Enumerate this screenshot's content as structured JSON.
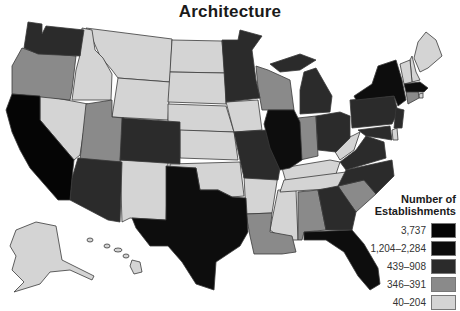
{
  "title": "Architecture",
  "legend": {
    "title_line1": "Number of",
    "title_line2": "Establishments",
    "items": [
      {
        "label": "3,737",
        "color": "#050505"
      },
      {
        "label": "1,204–2,284",
        "color": "#0d0d0d"
      },
      {
        "label": "439–908",
        "color": "#2b2b2b"
      },
      {
        "label": "346–391",
        "color": "#8a8a8a"
      },
      {
        "label": "40–204",
        "color": "#d4d4d4"
      }
    ]
  },
  "categories": {
    "3,737": [
      "CA"
    ],
    "1,204–2,284": [
      "NY",
      "TX",
      "FL",
      "IL",
      "MA"
    ],
    "439–908": [
      "WA",
      "CO",
      "AZ",
      "MN",
      "MI",
      "OH",
      "PA",
      "MO",
      "NJ",
      "VA",
      "NC",
      "GA",
      "TN-none",
      "MD"
    ],
    "346–391": [
      "OR",
      "UT",
      "WI",
      "IN",
      "SC",
      "AL",
      "LA",
      "CT"
    ],
    "40–204": [
      "ID",
      "MT",
      "WY",
      "NV",
      "ND",
      "SD",
      "NE",
      "KS",
      "OK",
      "NM",
      "IA",
      "AR",
      "MS",
      "KY",
      "TN",
      "WV",
      "ME",
      "NH",
      "VT",
      "RI",
      "DE",
      "AK",
      "HI"
    ]
  }
}
